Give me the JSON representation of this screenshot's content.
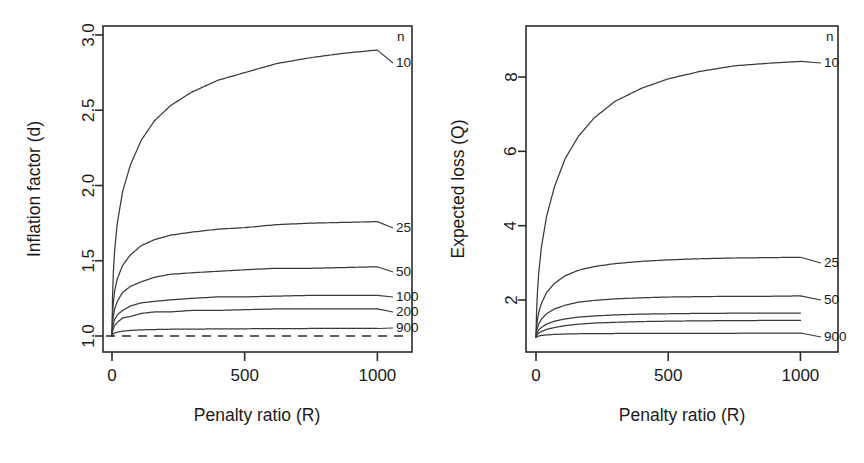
{
  "figure": {
    "panels": [
      {
        "id": "left",
        "y_axis_title": "Inflation factor  (d)",
        "x_axis_title": "Penalty ratio  (R)",
        "legend_header": "n",
        "y_ticks": [
          "1.0",
          "1.5",
          "2.0",
          "2.5",
          "3.0"
        ],
        "x_ticks": [
          "0",
          "500",
          "1000"
        ],
        "series_labels": [
          "10",
          "25",
          "50",
          "100",
          "200",
          "900"
        ]
      },
      {
        "id": "right",
        "y_axis_title": "Expected loss  (Q)",
        "x_axis_title": "Penalty ratio  (R)",
        "legend_header": "n",
        "y_ticks": [
          "2",
          "4",
          "6",
          "8"
        ],
        "x_ticks": [
          "0",
          "500",
          "1000"
        ],
        "series_labels": [
          "10",
          "25",
          "50",
          "900"
        ]
      }
    ],
    "colors": {
      "curve": "#3a3a3a",
      "axis": "#2b2b2b",
      "background": "#ffffff"
    }
  },
  "chart_data": [
    {
      "type": "line",
      "title": "",
      "panel": "left",
      "xlabel": "Penalty ratio  (R)",
      "ylabel": "Inflation factor  (d)",
      "xlim": [
        0,
        1040
      ],
      "ylim": [
        0.95,
        3.08
      ],
      "grid": false,
      "legend_position": "right-inside",
      "legend_title": "n",
      "x_ticks": [
        0,
        500,
        1000
      ],
      "y_ticks": [
        1.0,
        1.5,
        2.0,
        2.5,
        3.0
      ],
      "reference_line": {
        "y": 1.0,
        "style": "dashed"
      },
      "x": [
        0,
        2,
        5,
        10,
        20,
        40,
        70,
        110,
        160,
        220,
        300,
        400,
        500,
        620,
        750,
        880,
        1000
      ],
      "series": [
        {
          "name": "10",
          "values": [
            1.0,
            1.26,
            1.42,
            1.57,
            1.75,
            1.96,
            2.14,
            2.3,
            2.43,
            2.53,
            2.62,
            2.7,
            2.75,
            2.81,
            2.85,
            2.88,
            2.9
          ]
        },
        {
          "name": "25",
          "values": [
            1.0,
            1.14,
            1.22,
            1.3,
            1.38,
            1.47,
            1.54,
            1.6,
            1.64,
            1.67,
            1.69,
            1.71,
            1.72,
            1.74,
            1.75,
            1.755,
            1.76
          ]
        },
        {
          "name": "50",
          "values": [
            1.0,
            1.08,
            1.13,
            1.18,
            1.23,
            1.29,
            1.33,
            1.36,
            1.39,
            1.41,
            1.42,
            1.43,
            1.44,
            1.45,
            1.45,
            1.455,
            1.46
          ]
        },
        {
          "name": "100",
          "values": [
            1.0,
            1.05,
            1.08,
            1.11,
            1.14,
            1.17,
            1.2,
            1.22,
            1.23,
            1.24,
            1.25,
            1.26,
            1.26,
            1.265,
            1.27,
            1.27,
            1.27
          ]
        },
        {
          "name": "200",
          "values": [
            1.0,
            1.03,
            1.05,
            1.07,
            1.09,
            1.12,
            1.13,
            1.15,
            1.16,
            1.16,
            1.17,
            1.17,
            1.175,
            1.18,
            1.18,
            1.18,
            1.18
          ]
        },
        {
          "name": "900",
          "values": [
            1.0,
            1.01,
            1.015,
            1.02,
            1.026,
            1.032,
            1.037,
            1.041,
            1.043,
            1.045,
            1.046,
            1.047,
            1.048,
            1.049,
            1.05,
            1.05,
            1.05
          ]
        }
      ]
    },
    {
      "type": "line",
      "title": "",
      "panel": "right",
      "xlabel": "Penalty ratio  (R)",
      "ylabel": "Expected loss  (Q)",
      "xlim": [
        0,
        1040
      ],
      "ylim": [
        0.9,
        8.9
      ],
      "grid": false,
      "legend_position": "right-inside",
      "legend_title": "n",
      "x_ticks": [
        0,
        500,
        1000
      ],
      "y_ticks": [
        2,
        4,
        6,
        8
      ],
      "x": [
        0,
        2,
        5,
        10,
        20,
        40,
        70,
        110,
        160,
        220,
        300,
        400,
        500,
        620,
        750,
        880,
        1000
      ],
      "series": [
        {
          "name": "10",
          "values": [
            1.0,
            1.65,
            2.15,
            2.7,
            3.4,
            4.25,
            5.05,
            5.8,
            6.4,
            6.9,
            7.35,
            7.7,
            7.95,
            8.15,
            8.3,
            8.37,
            8.42
          ]
        },
        {
          "name": "25",
          "values": [
            1.0,
            1.25,
            1.45,
            1.65,
            1.9,
            2.2,
            2.45,
            2.65,
            2.8,
            2.9,
            2.98,
            3.04,
            3.08,
            3.11,
            3.13,
            3.14,
            3.15
          ]
        },
        {
          "name": "50",
          "values": [
            1.0,
            1.13,
            1.24,
            1.35,
            1.48,
            1.63,
            1.76,
            1.86,
            1.94,
            1.99,
            2.03,
            2.06,
            2.08,
            2.09,
            2.1,
            2.1,
            2.11
          ]
        },
        {
          "name": "100",
          "values": [
            1.0,
            1.07,
            1.13,
            1.19,
            1.26,
            1.35,
            1.43,
            1.49,
            1.54,
            1.57,
            1.6,
            1.62,
            1.63,
            1.64,
            1.645,
            1.65,
            1.65
          ]
        },
        {
          "name": "200",
          "values": [
            1.0,
            1.04,
            1.07,
            1.11,
            1.15,
            1.21,
            1.26,
            1.31,
            1.35,
            1.38,
            1.4,
            1.42,
            1.43,
            1.44,
            1.445,
            1.45,
            1.45
          ]
        },
        {
          "name": "900",
          "values": [
            1.0,
            1.01,
            1.02,
            1.03,
            1.045,
            1.06,
            1.075,
            1.085,
            1.092,
            1.096,
            1.099,
            1.1,
            1.1,
            1.105,
            1.105,
            1.11,
            1.11
          ]
        }
      ]
    }
  ]
}
